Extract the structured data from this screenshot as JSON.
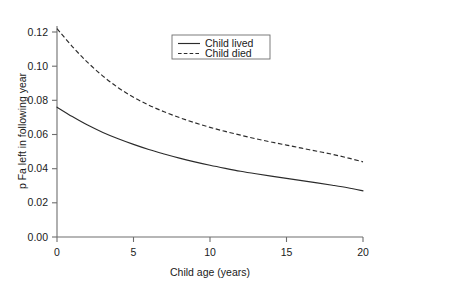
{
  "chart_data": {
    "type": "line",
    "title": "",
    "subtitle": "",
    "xlabel": "Child age (years)",
    "ylabel": "p Fa left in following year",
    "xlim": [
      0,
      20
    ],
    "ylim": [
      0.0,
      0.128
    ],
    "xticks": [
      0,
      5,
      10,
      15,
      20
    ],
    "xtick_labels": [
      "0",
      "5",
      "10",
      "15",
      "20"
    ],
    "yticks": [
      0.0,
      0.02,
      0.04,
      0.06,
      0.08,
      0.1,
      0.12
    ],
    "ytick_labels": [
      "0.00",
      "0.02",
      "0.04",
      "0.06",
      "0.08",
      "0.10",
      "0.12"
    ],
    "grid": false,
    "legend_position": "top-center",
    "x": [
      0,
      1,
      2,
      3,
      4,
      5,
      6,
      7,
      8,
      9,
      10,
      11,
      12,
      13,
      14,
      15,
      16,
      17,
      18,
      19,
      20
    ],
    "series": [
      {
        "name": "Child lived",
        "style": "solid",
        "color": "#2b2b2b",
        "values": [
          0.076,
          0.0705,
          0.0655,
          0.0612,
          0.0575,
          0.0542,
          0.0512,
          0.0486,
          0.0462,
          0.044,
          0.042,
          0.0402,
          0.0385,
          0.037,
          0.0356,
          0.0343,
          0.033,
          0.0317,
          0.0303,
          0.0288,
          0.027
        ]
      },
      {
        "name": "Child died",
        "style": "dashed",
        "color": "#2b2b2b",
        "values": [
          0.122,
          0.1115,
          0.1022,
          0.0942,
          0.0874,
          0.0818,
          0.0772,
          0.0733,
          0.0699,
          0.0669,
          0.0642,
          0.0618,
          0.0596,
          0.0575,
          0.0556,
          0.0538,
          0.052,
          0.0502,
          0.0484,
          0.0463,
          0.044
        ]
      }
    ]
  },
  "legend": {
    "entries": [
      {
        "label": "Child lived",
        "style": "solid"
      },
      {
        "label": "Child died",
        "style": "dashed"
      }
    ]
  },
  "axes": {
    "x_title": "Child age (years)",
    "y_title": "p Fa left in following year"
  }
}
